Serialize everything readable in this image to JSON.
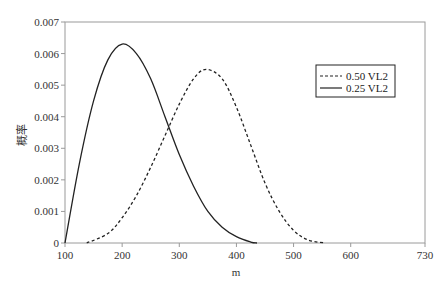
{
  "chart_data": {
    "type": "line",
    "title": "",
    "xlabel": "m",
    "ylabel": "概率",
    "xlim": [
      100,
      730
    ],
    "ylim": [
      0,
      0.007
    ],
    "x_ticks": [
      100,
      200,
      300,
      400,
      500,
      600,
      730
    ],
    "x_tick_labels": [
      "100",
      "200",
      "300",
      "400",
      "500",
      "600",
      "730"
    ],
    "y_ticks": [
      0,
      0.001,
      0.002,
      0.003,
      0.004,
      0.005,
      0.006,
      0.007
    ],
    "y_tick_labels": [
      "0",
      "0.001",
      "0.002",
      "0.003",
      "0.004",
      "0.005",
      "0.006",
      "0.007"
    ],
    "grid": false,
    "legend_position": "upper right",
    "series": [
      {
        "name": "0.50 VL2",
        "style": "dashed",
        "color": "#222222",
        "x": [
          138,
          175,
          200,
          225,
          250,
          275,
          300,
          325,
          347,
          375,
          400,
          425,
          450,
          475,
          500,
          525,
          555
        ],
        "values": [
          0,
          0.0003,
          0.0008,
          0.0015,
          0.0024,
          0.0034,
          0.0044,
          0.0052,
          0.0055,
          0.0052,
          0.0043,
          0.0031,
          0.0019,
          0.001,
          0.0004,
          0.0001,
          0
        ]
      },
      {
        "name": "0.25 VL2",
        "style": "solid",
        "color": "#222222",
        "x": [
          100,
          125,
          150,
          175,
          200,
          225,
          250,
          275,
          300,
          325,
          350,
          375,
          400,
          425,
          436
        ],
        "values": [
          0,
          0.0025,
          0.0045,
          0.0058,
          0.0063,
          0.006,
          0.0052,
          0.004,
          0.0028,
          0.0018,
          0.001,
          0.0005,
          0.0002,
          3e-05,
          0
        ]
      }
    ]
  }
}
